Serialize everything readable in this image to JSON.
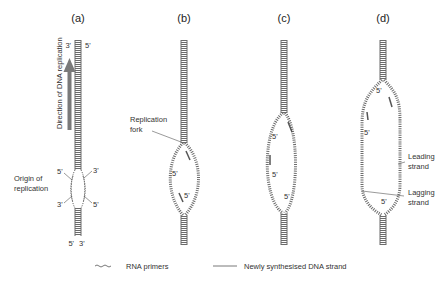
{
  "diagram": {
    "panels": [
      {
        "id": "a",
        "label": "(a)",
        "top_ends": [
          "3'",
          "5'"
        ],
        "bottom_ends": [
          "5'",
          "3'"
        ],
        "bubble_ends": {
          "upper_left": "5'",
          "upper_right": "3'",
          "lower_left": "3'",
          "lower_right": "5'"
        },
        "side_label": "Direction of DNA replication",
        "annotation": "Origin of\nreplication",
        "annotation_lines": [
          "Origin of",
          "replication"
        ]
      },
      {
        "id": "b",
        "label": "(b)",
        "annotation_lines": [
          "Replication",
          "fork"
        ],
        "inner_labels": [
          "5'",
          "5'"
        ]
      },
      {
        "id": "c",
        "label": "(c)",
        "inner_labels": [
          "5'",
          "5'",
          "5'"
        ]
      },
      {
        "id": "d",
        "label": "(d)",
        "inner_labels": [
          "5'",
          "5'",
          "5'"
        ],
        "annotations": [
          {
            "lines": [
              "Leading",
              "strand"
            ]
          },
          {
            "lines": [
              "Lagging",
              "strand"
            ]
          }
        ]
      }
    ],
    "legend": [
      {
        "symbol": "wavy-line",
        "label": "RNA primers"
      },
      {
        "symbol": "straight-line",
        "label": "Newly synthesised DNA strand"
      }
    ],
    "colors": {
      "strand": "#6b6b6b",
      "arrow": "#7a7a7a",
      "text": "#333333"
    }
  }
}
